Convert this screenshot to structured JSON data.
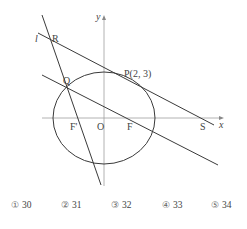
{
  "diagram": {
    "axes": {
      "x_label": "x",
      "y_label": "y",
      "origin_label": "O"
    },
    "points": {
      "P": "P(2, 3)",
      "Q": "Q",
      "R": "R",
      "S": "S",
      "F": "F",
      "F_prime": "F'"
    },
    "line_label": "l"
  },
  "choices": [
    {
      "marker": "①",
      "value": "30"
    },
    {
      "marker": "②",
      "value": "31"
    },
    {
      "marker": "③",
      "value": "32"
    },
    {
      "marker": "④",
      "value": "33"
    },
    {
      "marker": "⑤",
      "value": "34"
    }
  ],
  "colors": {
    "line": "#3a3a3a",
    "axis": "#9a9a9a",
    "text": "#444444"
  }
}
